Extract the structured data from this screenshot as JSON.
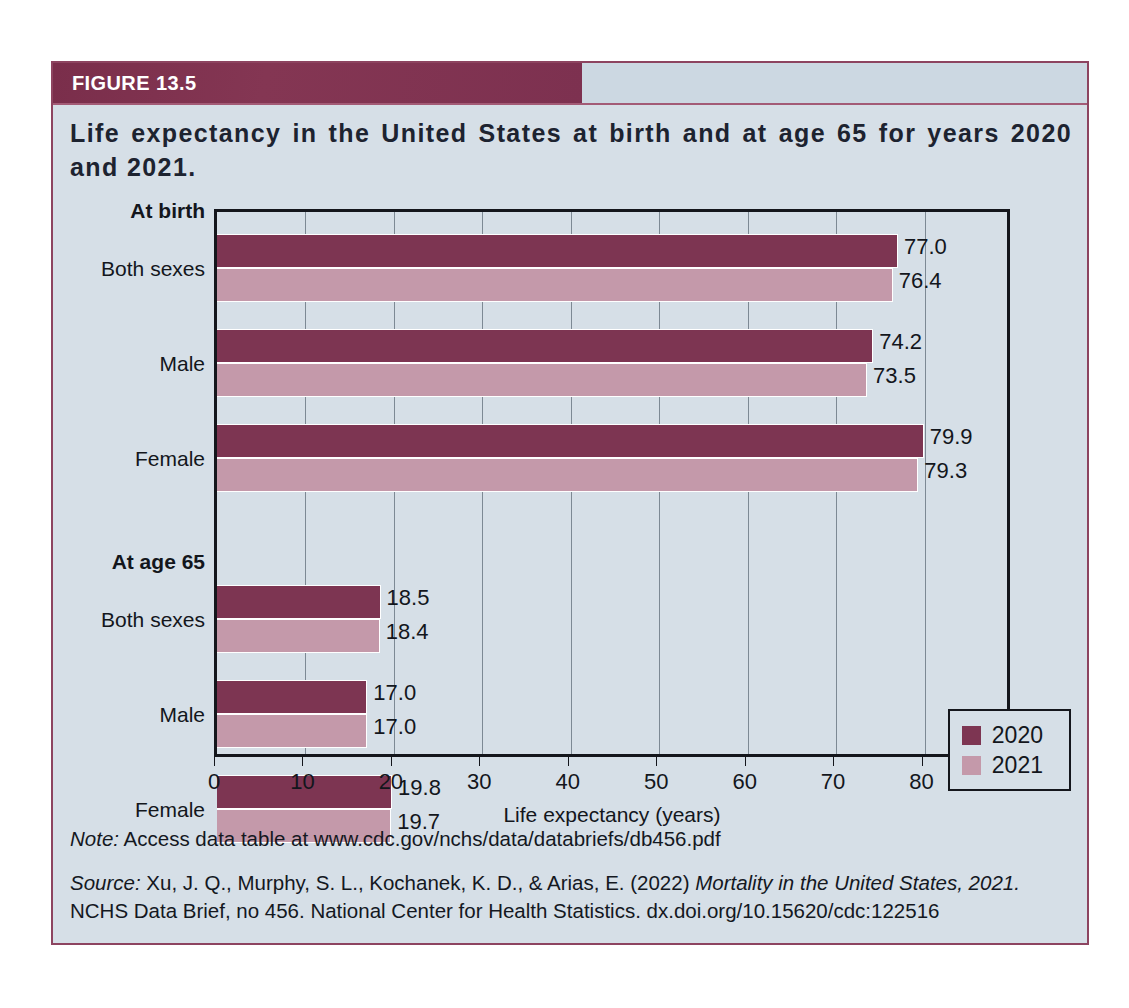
{
  "figure": {
    "number_label": "FIGURE 13.5",
    "title": "Life expectancy in the United States at birth and at age 65 for years 2020 and 2021.",
    "note_prefix": "Note:",
    "note_text": " Access data table at www.cdc.gov/nchs/data/databriefs/db456.pdf",
    "source_prefix": "Source:",
    "source_text_1": " Xu, J. Q., Murphy, S. L., Kochanek, K. D., & Arias, E. (2022) ",
    "source_italic_title": "Mortality in the United States, 2021.",
    "source_text_2": "NCHS Data Brief, no 456. National Center for Health Statistics. dx.doi.org/10.15620/cdc:122516"
  },
  "colors": {
    "header_band": "#7b2f4c",
    "panel_background": "#d6dfe7",
    "series_2020": "#7d3552",
    "series_2021": "#c499aa",
    "axis": "#14161c"
  },
  "chart_data": {
    "type": "bar",
    "orientation": "horizontal",
    "title": "Life expectancy in the United States at birth and at age 65 for years 2020 and 2021.",
    "xlabel": "Life expectancy (years)",
    "ylabel": "",
    "xlim": [
      0,
      90
    ],
    "xticks": [
      0,
      10,
      20,
      30,
      40,
      50,
      60,
      70,
      80,
      90
    ],
    "grid": true,
    "legend_position": "bottom-right",
    "groups": [
      {
        "group_label": "At birth",
        "categories": [
          "Both sexes",
          "Male",
          "Female"
        ],
        "values_2020": [
          77.0,
          74.2,
          79.9
        ],
        "values_2021": [
          76.4,
          73.5,
          79.3
        ]
      },
      {
        "group_label": "At age 65",
        "categories": [
          "Both sexes",
          "Male",
          "Female"
        ],
        "values_2020": [
          18.5,
          17.0,
          19.8
        ],
        "values_2021": [
          18.4,
          17.0,
          19.7
        ]
      }
    ],
    "series": [
      {
        "name": "2020",
        "color": "#7d3552",
        "values": [
          77.0,
          74.2,
          79.9,
          18.5,
          17.0,
          19.8
        ]
      },
      {
        "name": "2021",
        "color": "#c499aa",
        "values": [
          76.4,
          73.5,
          79.3,
          18.4,
          17.0,
          19.7
        ]
      }
    ],
    "categories": [
      "At birth - Both sexes",
      "At birth - Male",
      "At birth - Female",
      "At age 65 - Both sexes",
      "At age 65 - Male",
      "At age 65 - Female"
    ],
    "data_labels": [
      "77.0",
      "76.4",
      "74.2",
      "73.5",
      "79.9",
      "79.3",
      "18.5",
      "18.4",
      "17.0",
      "17.0",
      "19.8",
      "19.7"
    ],
    "legend": [
      {
        "label": "2020",
        "color": "#7d3552"
      },
      {
        "label": "2021",
        "color": "#c499aa"
      }
    ]
  }
}
